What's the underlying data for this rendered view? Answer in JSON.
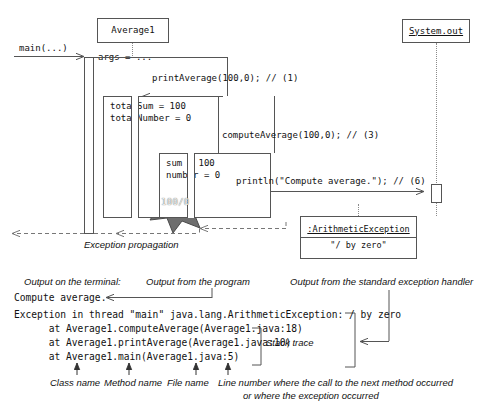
{
  "diagram": {
    "objects": {
      "average1": {
        "name": "Average1",
        "underlined": false
      },
      "system_out": {
        "name": "System.out",
        "underlined": true
      },
      "arithmetic_exception": {
        "name": ":ArithmeticException",
        "underlined": true,
        "attribute": "\"/ by zero\""
      }
    },
    "activations": {
      "main": {
        "label": "args = ..."
      },
      "print_average": {
        "label_line1": "totalSum = 100",
        "label_line2": "totalNumber = 0"
      },
      "compute_average": {
        "label_line1": "sum = 100",
        "label_line2": "number = 0"
      }
    },
    "messages": {
      "main_call": "main(...)",
      "print_average_call": "printAverage(100,0); // (1)",
      "compute_average_call": "computeAverage(100,0); // (3)",
      "println_call": "println(\"Compute average.\"); // (6)"
    },
    "starburst": {
      "label": "100/0",
      "fill": "#6e6e6e"
    },
    "captions": {
      "exception_propagation": "Exception propagation"
    }
  },
  "terminal": {
    "captions": {
      "output_on_terminal": "Output on the terminal:",
      "output_from_program": "Output from the program",
      "output_from_handler": "Output from the standard exception handler",
      "stack_trace": "Stack trace"
    },
    "lines": [
      "Compute average.",
      "Exception in thread \"main\" java.lang.ArithmeticException: / by zero",
      "      at Average1.computeAverage(Average1.java:18)",
      "      at Average1.printAverage(Average1.java:10)",
      "      at Average1.main(Average1.java:5)"
    ],
    "legend": {
      "class_name": "Class name",
      "method_name": "Method name",
      "file_name": "File name",
      "line_number_line1": "Line number where the call to the next method occurred",
      "line_number_line2": "or where the exception occurred"
    }
  },
  "colors": {
    "stroke": "#555555",
    "dashed": "#777777",
    "star_fill": "#6e6e6e",
    "star_text": "#f0f0f0",
    "background": "#ffffff"
  }
}
